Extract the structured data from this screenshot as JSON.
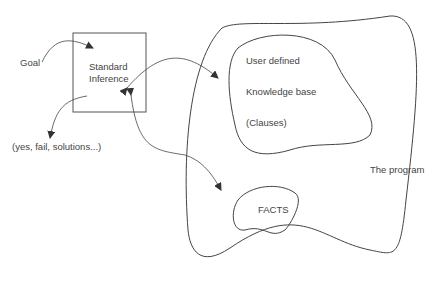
{
  "diagram": {
    "goal_label": "Goal",
    "inference_box": {
      "line1": "Standard",
      "line2": "Inference"
    },
    "output_label": "(yes, fail, solutions...)",
    "knowledge_base": {
      "line1": "User defined",
      "line2": "Knowledge base",
      "line3": "(Clauses)"
    },
    "facts_label": "FACTS",
    "program_label": "The program",
    "colors": {
      "stroke": "#444444",
      "arrow": "#333333",
      "text": "#444444"
    }
  }
}
